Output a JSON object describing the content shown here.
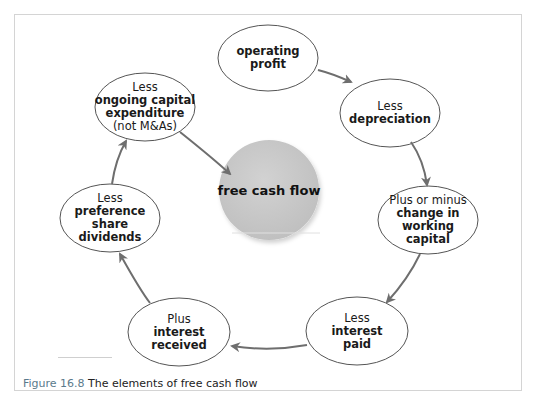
{
  "figure": {
    "caption_number": "Figure 16.8",
    "caption_text": "The elements of free cash flow"
  },
  "center": {
    "label": "free cash flow",
    "fill_color": "#c8c8c8"
  },
  "nodes": [
    {
      "id": "operating-profit",
      "prefix": "",
      "lines": [
        "operating",
        "profit"
      ],
      "note": ""
    },
    {
      "id": "depreciation",
      "prefix": "Less",
      "lines": [
        "depreciation"
      ],
      "note": ""
    },
    {
      "id": "working-capital",
      "prefix": "Plus or minus",
      "lines": [
        "change in",
        "working",
        "capital"
      ],
      "note": ""
    },
    {
      "id": "interest-paid",
      "prefix": "Less",
      "lines": [
        "interest",
        "paid"
      ],
      "note": ""
    },
    {
      "id": "interest-received",
      "prefix": "Plus",
      "lines": [
        "interest",
        "received"
      ],
      "note": ""
    },
    {
      "id": "preference-dividends",
      "prefix": "Less",
      "lines": [
        "preference",
        "share",
        "dividends"
      ],
      "note": ""
    },
    {
      "id": "capital-expenditure",
      "prefix": "Less",
      "lines": [
        "ongoing capital",
        "expenditure"
      ],
      "note": "(not M&As)"
    }
  ],
  "colors": {
    "arrow": "#6e6e6e",
    "ellipse_stroke": "#555555",
    "frame_border": "#d4d4d4",
    "caption_accent": "#5a7a8c"
  }
}
